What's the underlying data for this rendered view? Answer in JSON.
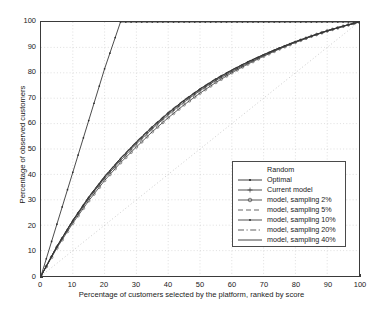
{
  "chart_data": {
    "type": "line",
    "title": "",
    "xlabel": "Percentage of customers selected by the platform, ranked by score",
    "ylabel": "Percentage of observed customers",
    "xlim": [
      0,
      100
    ],
    "ylim": [
      0,
      100
    ],
    "xticks": [
      0,
      10,
      20,
      30,
      40,
      50,
      60,
      70,
      80,
      90,
      100
    ],
    "yticks": [
      0,
      10,
      20,
      30,
      40,
      50,
      60,
      70,
      80,
      90,
      100
    ],
    "grid": true,
    "legend_position": "lower-right",
    "x": [
      0,
      5,
      10,
      15,
      20,
      25,
      30,
      35,
      40,
      45,
      50,
      55,
      60,
      65,
      70,
      75,
      80,
      85,
      90,
      95,
      100
    ],
    "series": [
      {
        "name": "Random",
        "style": "dotted",
        "marker": "none",
        "color": "#b4b4b4",
        "values": [
          0,
          5,
          10,
          15,
          20,
          25,
          30,
          35,
          40,
          45,
          50,
          55,
          60,
          65,
          70,
          75,
          80,
          85,
          90,
          95,
          100
        ]
      },
      {
        "name": "Optimal",
        "style": "solid",
        "marker": "dot",
        "color": "#2b2b2b",
        "values": [
          0,
          20.4,
          40.8,
          61.2,
          81.6,
          100,
          100,
          100,
          100,
          100,
          100,
          100,
          100,
          100,
          100,
          100,
          100,
          100,
          100,
          100,
          100
        ]
      },
      {
        "name": "Current model",
        "style": "solid",
        "marker": "plus",
        "color": "#3a3a3a",
        "values": [
          0,
          11.5,
          21.5,
          30.5,
          38.5,
          45.5,
          52.0,
          58.0,
          63.5,
          68.5,
          73.0,
          77.0,
          80.5,
          83.8,
          86.8,
          89.5,
          92.0,
          94.3,
          96.4,
          98.3,
          100
        ]
      },
      {
        "name": "model, sampling 2%",
        "style": "solid",
        "marker": "circle",
        "color": "#444444",
        "values": [
          0,
          11.0,
          20.8,
          29.6,
          37.6,
          44.6,
          50.8,
          56.8,
          62.3,
          67.4,
          72.0,
          76.2,
          80.0,
          83.4,
          86.5,
          89.4,
          92.0,
          94.4,
          96.5,
          98.3,
          100
        ]
      },
      {
        "name": "model, sampling 5%",
        "style": "dashed",
        "marker": "none",
        "color": "#555555",
        "values": [
          0,
          11.8,
          22.0,
          31.2,
          39.3,
          46.4,
          53.0,
          59.0,
          64.5,
          69.4,
          73.8,
          77.8,
          81.2,
          84.4,
          87.2,
          89.9,
          92.3,
          94.5,
          96.6,
          98.4,
          100
        ]
      },
      {
        "name": "model, sampling 10%",
        "style": "solid",
        "marker": "dot",
        "color": "#3f3f3f",
        "values": [
          0,
          11.6,
          21.8,
          31.0,
          39.0,
          46.2,
          52.6,
          58.6,
          64.1,
          69.1,
          73.5,
          77.5,
          81.0,
          84.2,
          87.1,
          89.8,
          92.2,
          94.4,
          96.5,
          98.3,
          100
        ]
      },
      {
        "name": "model, sampling 20%",
        "style": "dashdot",
        "marker": "none",
        "color": "#4d4d4d",
        "values": [
          0,
          11.4,
          21.4,
          30.6,
          38.8,
          46.0,
          52.4,
          58.4,
          63.9,
          68.9,
          73.4,
          77.4,
          80.9,
          84.1,
          87.0,
          89.7,
          92.1,
          94.4,
          96.5,
          98.3,
          100
        ]
      },
      {
        "name": "model, sampling 40%",
        "style": "solid",
        "marker": "none",
        "color": "#2f2f2f",
        "values": [
          0,
          11.7,
          21.9,
          31.1,
          39.2,
          46.3,
          52.8,
          58.8,
          64.3,
          69.2,
          73.7,
          77.6,
          81.1,
          84.3,
          87.2,
          89.8,
          92.3,
          94.5,
          96.6,
          98.4,
          100
        ]
      }
    ]
  }
}
